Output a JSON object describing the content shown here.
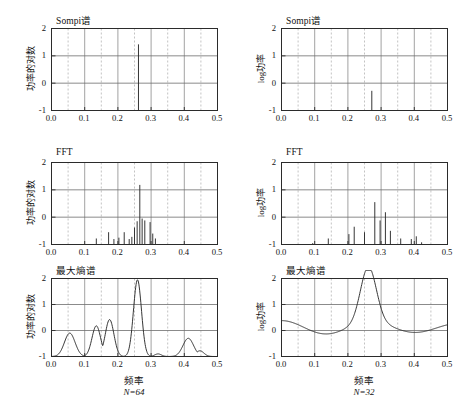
{
  "figure": {
    "columns": [
      {
        "id": "left",
        "ylabel": "功率的对数",
        "xlabel": "频率",
        "caption": "N=64"
      },
      {
        "id": "right",
        "ylabel": "log功率",
        "xlabel": "频率",
        "caption": "N=32"
      }
    ],
    "xticks": [
      "0.0",
      "0.1",
      "0.2",
      "0.3",
      "0.4",
      "0.5"
    ],
    "xtick_values": [
      0.0,
      0.1,
      0.2,
      0.3,
      0.4,
      0.5
    ],
    "yticks": [
      "2",
      "1",
      "0",
      "-1"
    ],
    "ytick_values": [
      2,
      1,
      0,
      -1
    ]
  },
  "chart_data": [
    {
      "id": "sompi-left",
      "type": "bar",
      "title": "Sompi谱",
      "xlabel": "频率",
      "ylabel": "功率的对数",
      "caption": "N=64",
      "xlim": [
        0.0,
        0.5
      ],
      "ylim": [
        -1,
        2
      ],
      "grid": true,
      "x": [
        0.262
      ],
      "values": [
        1.42
      ],
      "baseline": -1,
      "annotations": [
        "single sharp spectral line at f≈0.262"
      ]
    },
    {
      "id": "sompi-right",
      "type": "bar",
      "title": "Sompi谱",
      "xlabel": "频率",
      "ylabel": "log功率",
      "caption": "N=32",
      "xlim": [
        0.0,
        0.5
      ],
      "ylim": [
        -1,
        2
      ],
      "grid": true,
      "x": [
        0.272
      ],
      "values": [
        -0.28
      ],
      "baseline": -1,
      "annotations": [
        "single short spectral line at f≈0.272"
      ]
    },
    {
      "id": "fft-left",
      "type": "bar",
      "title": "FFT",
      "xlabel": "频率",
      "ylabel": "功率的对数",
      "caption": "N=64",
      "xlim": [
        0.0,
        0.5
      ],
      "ylim": [
        -1,
        2
      ],
      "grid": true,
      "x": [
        0.135,
        0.172,
        0.188,
        0.203,
        0.219,
        0.234,
        0.242,
        0.25,
        0.258,
        0.266,
        0.273,
        0.281,
        0.297,
        0.305,
        0.313
      ],
      "values": [
        -0.78,
        -0.55,
        -0.8,
        -0.75,
        -0.55,
        -0.8,
        -0.72,
        -0.38,
        -0.15,
        1.18,
        -0.05,
        -0.12,
        -0.18,
        -0.6,
        -0.78
      ],
      "baseline": -1
    },
    {
      "id": "fft-right",
      "type": "bar",
      "title": "FFT",
      "xlabel": "频率",
      "ylabel": "log功率",
      "caption": "N=32",
      "xlim": [
        0.0,
        0.5
      ],
      "ylim": [
        -1,
        2
      ],
      "grid": true,
      "x": [
        0.094,
        0.141,
        0.203,
        0.219,
        0.25,
        0.281,
        0.297,
        0.313,
        0.328,
        0.359,
        0.391,
        0.406,
        0.422
      ],
      "values": [
        -0.95,
        -0.78,
        -0.62,
        -0.35,
        -0.55,
        0.55,
        -0.12,
        0.18,
        -0.5,
        -0.78,
        -0.8,
        -0.7,
        -0.92
      ],
      "baseline": -1
    },
    {
      "id": "mem-left",
      "type": "line",
      "title": "最大熵谱",
      "xlabel": "频率",
      "ylabel": "功率的对数",
      "caption": "N=64",
      "xlim": [
        0.0,
        0.5
      ],
      "ylim": [
        -1,
        2
      ],
      "grid": true,
      "peaks": [
        {
          "center": 0.055,
          "height": -0.1,
          "width": 0.016
        },
        {
          "center": 0.135,
          "height": 0.18,
          "width": 0.013
        },
        {
          "center": 0.175,
          "height": 0.42,
          "width": 0.013
        },
        {
          "center": 0.259,
          "height": 1.95,
          "width": 0.012
        },
        {
          "center": 0.321,
          "height": -0.9,
          "width": 0.01
        },
        {
          "center": 0.412,
          "height": -0.3,
          "width": 0.016
        },
        {
          "center": 0.447,
          "height": -0.78,
          "width": 0.012
        }
      ],
      "floor": -1.0
    },
    {
      "id": "mem-right",
      "type": "line",
      "title": "最大熵谱",
      "xlabel": "频率",
      "ylabel": "log功率",
      "caption": "N=32",
      "xlim": [
        0.0,
        0.5
      ],
      "ylim": [
        -1,
        2
      ],
      "grid": true,
      "peaks": [
        {
          "center": 0.262,
          "height": 2.45,
          "width": 0.022
        }
      ],
      "floor": 0.0,
      "annotations": [
        "broad single resonance peak clipped at top of axis"
      ]
    }
  ]
}
